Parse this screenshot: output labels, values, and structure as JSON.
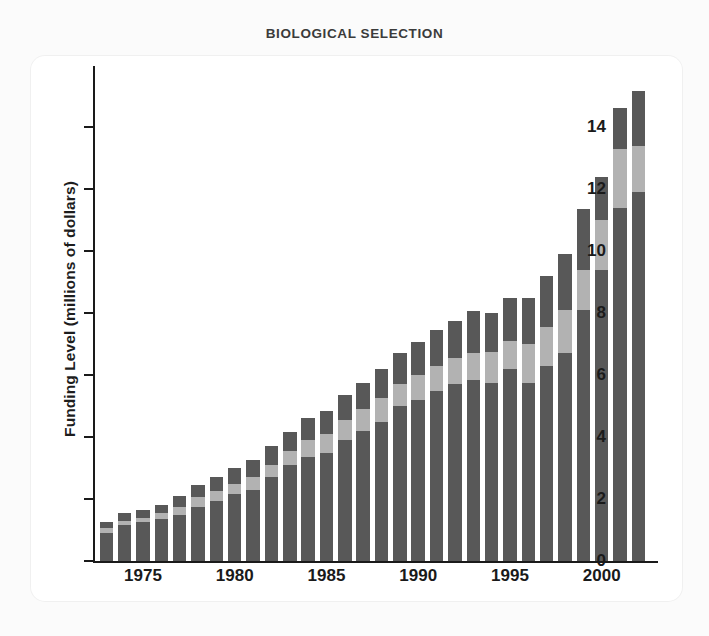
{
  "figure": {
    "title": "BIOLOGICAL SELECTION",
    "background_color": "#ffffff",
    "card_color": "#ffffff"
  },
  "axes": {
    "y_title": "Funding Level (millions of dollars)",
    "y_ticks": [
      "0",
      "2",
      "4",
      "6",
      "8",
      "10",
      "12",
      "14"
    ],
    "x_ticks": [
      "1975",
      "1980",
      "1985",
      "1990",
      "1995",
      "2000"
    ]
  },
  "colors": {
    "segment_bottom": "#585858",
    "segment_middle": "#b2b2b2",
    "segment_top": "#585858",
    "axis": "#1a1a1a",
    "title": "#3b3b3b"
  },
  "chart_data": {
    "type": "bar",
    "stacked": true,
    "title": "BIOLOGICAL SELECTION",
    "xlabel": "",
    "ylabel": "Funding Level (millions of dollars)",
    "ylim": [
      0,
      15.5
    ],
    "xlim": [
      1972.5,
      2002.5
    ],
    "grid": false,
    "legend": "none",
    "categories": [
      "1973",
      "1974",
      "1975",
      "1976",
      "1977",
      "1978",
      "1979",
      "1980",
      "1981",
      "1982",
      "1983",
      "1984",
      "1985",
      "1986",
      "1987",
      "1988",
      "1989",
      "1990",
      "1991",
      "1992",
      "1993",
      "1994",
      "1995",
      "1996",
      "1997",
      "1998",
      "1999",
      "2000",
      "2001",
      "2002"
    ],
    "series": [
      {
        "name": "lower segment",
        "values": [
          0.9,
          1.15,
          1.25,
          1.35,
          1.5,
          1.75,
          1.95,
          2.15,
          2.3,
          2.7,
          3.1,
          3.35,
          3.5,
          3.9,
          4.2,
          4.5,
          5.0,
          5.2,
          5.5,
          5.7,
          5.85,
          5.75,
          6.2,
          5.75,
          6.3,
          6.7,
          8.1,
          9.4,
          11.4,
          11.9
        ]
      },
      {
        "name": "middle segment",
        "values": [
          0.15,
          0.15,
          0.15,
          0.2,
          0.25,
          0.3,
          0.3,
          0.35,
          0.4,
          0.4,
          0.45,
          0.55,
          0.6,
          0.65,
          0.7,
          0.75,
          0.7,
          0.8,
          0.8,
          0.85,
          0.85,
          1.0,
          0.9,
          1.25,
          1.25,
          1.4,
          1.3,
          1.6,
          1.9,
          1.5
        ]
      },
      {
        "name": "upper segment",
        "values": [
          0.2,
          0.25,
          0.25,
          0.25,
          0.35,
          0.4,
          0.45,
          0.5,
          0.55,
          0.6,
          0.6,
          0.7,
          0.75,
          0.8,
          0.85,
          0.95,
          1.0,
          1.05,
          1.15,
          1.2,
          1.35,
          1.25,
          1.4,
          1.5,
          1.65,
          1.8,
          1.95,
          1.4,
          1.3,
          1.75
        ]
      }
    ],
    "totals": [
      1.25,
      1.55,
      1.65,
      1.8,
      2.1,
      2.45,
      2.7,
      3.0,
      3.25,
      3.7,
      4.15,
      4.6,
      4.85,
      5.35,
      5.75,
      6.2,
      6.7,
      7.05,
      7.45,
      7.75,
      8.05,
      8.0,
      8.5,
      8.5,
      9.2,
      9.9,
      11.35,
      12.4,
      14.6,
      15.15
    ]
  }
}
